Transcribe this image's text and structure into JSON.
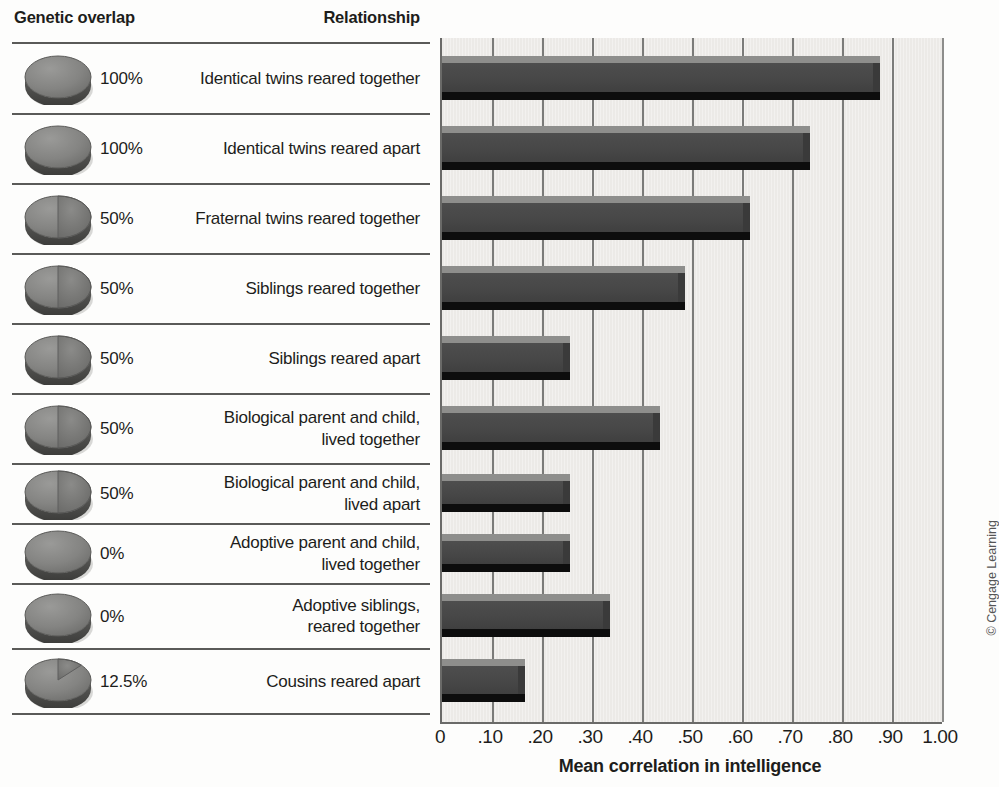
{
  "table": {
    "header_genetic": "Genetic overlap",
    "header_relationship": "Relationship"
  },
  "axis": {
    "title": "Mean correlation in intelligence",
    "ticks": [
      "0",
      ".10",
      ".20",
      ".30",
      ".40",
      ".50",
      ".60",
      ".70",
      ".80",
      ".90",
      "1.00"
    ]
  },
  "credit": "© Cengage Learning",
  "colors": {
    "bar_face": "#474747",
    "bar_top": "#8e8e8c",
    "bar_shadow": "#0d0d0d",
    "plot_background": "#eceae7",
    "gridline": "#7b7b79",
    "rule": "#5a5a58",
    "text": "#1d1d1b"
  },
  "chart_data": {
    "type": "bar",
    "orientation": "horizontal",
    "title": "",
    "xlabel": "Mean correlation in intelligence",
    "ylabel": "",
    "xlim": [
      0,
      1.0
    ],
    "xticks": [
      0,
      0.1,
      0.2,
      0.3,
      0.4,
      0.5,
      0.6,
      0.7,
      0.8,
      0.9,
      1.0
    ],
    "xtick_labels": [
      "0",
      ".10",
      ".20",
      ".30",
      ".40",
      ".50",
      ".60",
      ".70",
      ".80",
      ".90",
      "1.00"
    ],
    "grid": "vertical",
    "legend": "none",
    "categories": [
      "Identical twins reared together",
      "Identical twins reared apart",
      "Fraternal twins reared together",
      "Siblings reared together",
      "Siblings reared apart",
      "Biological parent and child, lived together",
      "Biological parent and child, lived apart",
      "Adoptive parent and child, lived together",
      "Adoptive siblings, reared together",
      "Cousins reared apart"
    ],
    "values": [
      0.86,
      0.72,
      0.6,
      0.47,
      0.24,
      0.42,
      0.24,
      0.24,
      0.32,
      0.15
    ]
  },
  "rows": [
    {
      "percent": "100%",
      "overlap_fraction": 1.0,
      "relationship": "Identical twins reared together",
      "value": 0.86
    },
    {
      "percent": "100%",
      "overlap_fraction": 1.0,
      "relationship": "Identical twins reared apart",
      "value": 0.72
    },
    {
      "percent": "50%",
      "overlap_fraction": 0.5,
      "relationship": "Fraternal twins reared together",
      "value": 0.6
    },
    {
      "percent": "50%",
      "overlap_fraction": 0.5,
      "relationship": "Siblings reared together",
      "value": 0.47
    },
    {
      "percent": "50%",
      "overlap_fraction": 0.5,
      "relationship": "Siblings reared apart",
      "value": 0.24
    },
    {
      "percent": "50%",
      "overlap_fraction": 0.5,
      "relationship": "Biological parent and child,\nlived together",
      "value": 0.42
    },
    {
      "percent": "50%",
      "overlap_fraction": 0.5,
      "relationship": "Biological parent and child,\nlived apart",
      "value": 0.24
    },
    {
      "percent": "0%",
      "overlap_fraction": 0.0,
      "relationship": "Adoptive parent and child,\nlived together",
      "value": 0.24
    },
    {
      "percent": "0%",
      "overlap_fraction": 0.0,
      "relationship": "Adoptive siblings,\nreared together",
      "value": 0.32
    },
    {
      "percent": "12.5%",
      "overlap_fraction": 0.125,
      "relationship": "Cousins reared apart",
      "value": 0.15
    }
  ]
}
